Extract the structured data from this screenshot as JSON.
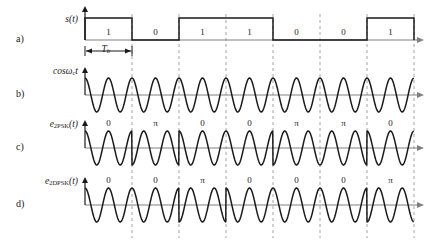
{
  "figure": {
    "rows": [
      {
        "tag": "a)",
        "axis_label_html": "s(t)",
        "baseline_y": 40,
        "kind": "nrz-pulse"
      },
      {
        "tag": "b)",
        "axis_label_html": "cos&#969;<sub>c</sub>t",
        "baseline_y": 95,
        "kind": "carrier"
      },
      {
        "tag": "c)",
        "axis_label_html": "e<sub>2PSK</sub>(t)",
        "baseline_y": 148,
        "kind": "psk"
      },
      {
        "tag": "d)",
        "axis_label_html": "e<sub>2DPSK</sub>(t)",
        "baseline_y": 205,
        "kind": "dpsk"
      }
    ],
    "row_tags": [
      "a)",
      "b)",
      "c)",
      "d)"
    ],
    "axis_labels": [
      "s(t)",
      "cosωc t",
      "e2PSK(t)",
      "e2DPSK(t)"
    ],
    "bit_period_label": "T",
    "bit_period_sub": "b",
    "bits": [
      "1",
      "0",
      "1",
      "1",
      "0",
      "0",
      "1"
    ],
    "psk_phases": [
      "0",
      "π",
      "0",
      "0",
      "π",
      "π",
      "0"
    ],
    "dpsk_phases": [
      "0",
      "0",
      "π",
      "0",
      "0",
      "0",
      "π"
    ],
    "geometry": {
      "origin_x": 85,
      "bit_width": 47,
      "n_bits": 7,
      "axis_arrow_x": 424,
      "pulse_height": 22,
      "wave_amplitude": 17,
      "cycles_per_bit": 2
    },
    "colors": {
      "ink": "#1a1a1a",
      "axis": "#808080",
      "grid": "#9a9a9a",
      "background": "#ffffff"
    }
  },
  "chart_data": {
    "type": "line",
    "title": "",
    "xlabel": "",
    "ylabel": "",
    "grid": true,
    "legend_position": "none",
    "categories": [
      "1",
      "0",
      "1",
      "1",
      "0",
      "0",
      "1"
    ],
    "series": [
      {
        "name": "s(t)",
        "values": [
          1,
          0,
          1,
          1,
          0,
          0,
          1
        ]
      },
      {
        "name": "cosωc t",
        "values": [
          0,
          0,
          0,
          0,
          0,
          0,
          0
        ]
      },
      {
        "name": "e2PSK(t) phase",
        "values": [
          "0",
          "π",
          "0",
          "0",
          "π",
          "π",
          "0"
        ]
      },
      {
        "name": "e2DPSK(t) phase",
        "values": [
          "0",
          "0",
          "π",
          "0",
          "0",
          "0",
          "π"
        ]
      }
    ]
  }
}
